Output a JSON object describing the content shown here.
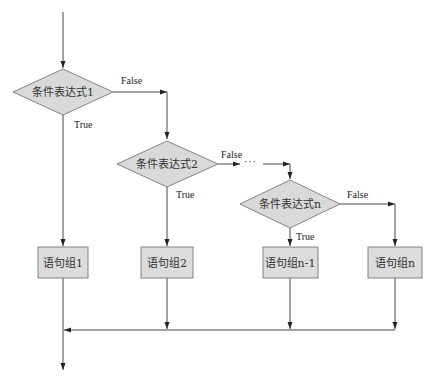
{
  "diagram": {
    "type": "flowchart",
    "colors": {
      "fill": "#d9d9d9",
      "stroke": "#666666",
      "line": "#333333"
    },
    "conditions": [
      {
        "id": "cond1",
        "label": "条件表达式1",
        "true_label": "True",
        "false_label": "False"
      },
      {
        "id": "cond2",
        "label": "条件表达式2",
        "true_label": "True",
        "false_label": "False"
      },
      {
        "id": "condn",
        "label": "条件表达式n",
        "true_label": "True",
        "false_label": "False"
      }
    ],
    "ellipsis": "···",
    "blocks": [
      {
        "id": "block1",
        "label": "语句组1"
      },
      {
        "id": "block2",
        "label": "语句组2"
      },
      {
        "id": "blockn1",
        "label": "语句组n-1"
      },
      {
        "id": "blockn",
        "label": "语句组n"
      }
    ]
  }
}
